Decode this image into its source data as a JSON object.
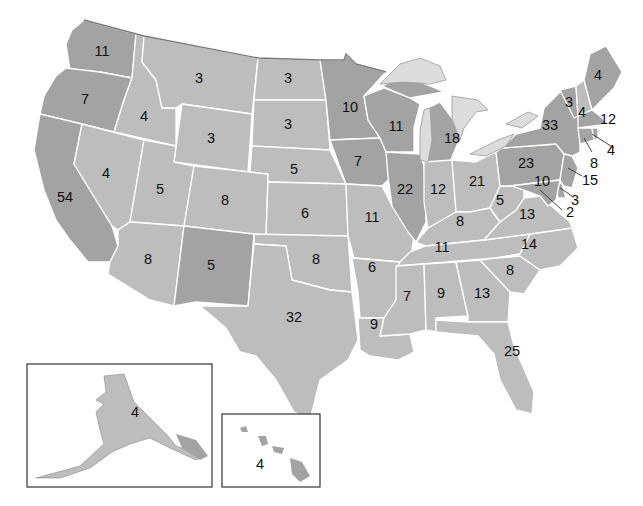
{
  "map": {
    "title": "Electoral votes by state",
    "colors": {
      "state_light": "#bdbdbd",
      "state_dark": "#a3a3a3",
      "borders": "#ffffff",
      "lakes": "#dcdcdc"
    },
    "states": [
      {
        "id": "WA",
        "votes": "11",
        "shade": "dark"
      },
      {
        "id": "OR",
        "votes": "7",
        "shade": "dark"
      },
      {
        "id": "CA",
        "votes": "54",
        "shade": "dark"
      },
      {
        "id": "ID",
        "votes": "4",
        "shade": "light"
      },
      {
        "id": "NV",
        "votes": "4",
        "shade": "light"
      },
      {
        "id": "MT",
        "votes": "3",
        "shade": "light"
      },
      {
        "id": "WY",
        "votes": "3",
        "shade": "light"
      },
      {
        "id": "UT",
        "votes": "5",
        "shade": "light"
      },
      {
        "id": "AZ",
        "votes": "8",
        "shade": "light"
      },
      {
        "id": "CO",
        "votes": "8",
        "shade": "light"
      },
      {
        "id": "NM",
        "votes": "5",
        "shade": "dark"
      },
      {
        "id": "ND",
        "votes": "3",
        "shade": "light"
      },
      {
        "id": "SD",
        "votes": "3",
        "shade": "light"
      },
      {
        "id": "NE",
        "votes": "5",
        "shade": "light"
      },
      {
        "id": "KS",
        "votes": "6",
        "shade": "light"
      },
      {
        "id": "OK",
        "votes": "8",
        "shade": "light"
      },
      {
        "id": "TX",
        "votes": "32",
        "shade": "light"
      },
      {
        "id": "MN",
        "votes": "10",
        "shade": "dark"
      },
      {
        "id": "IA",
        "votes": "7",
        "shade": "dark"
      },
      {
        "id": "MO",
        "votes": "11",
        "shade": "light"
      },
      {
        "id": "AR",
        "votes": "6",
        "shade": "light"
      },
      {
        "id": "LA",
        "votes": "9",
        "shade": "light"
      },
      {
        "id": "WI",
        "votes": "11",
        "shade": "dark"
      },
      {
        "id": "IL",
        "votes": "22",
        "shade": "dark"
      },
      {
        "id": "MI",
        "votes": "18",
        "shade": "dark"
      },
      {
        "id": "IN",
        "votes": "12",
        "shade": "light"
      },
      {
        "id": "OH",
        "votes": "21",
        "shade": "light"
      },
      {
        "id": "KY",
        "votes": "8",
        "shade": "light"
      },
      {
        "id": "TN",
        "votes": "11",
        "shade": "light"
      },
      {
        "id": "MS",
        "votes": "7",
        "shade": "light"
      },
      {
        "id": "AL",
        "votes": "9",
        "shade": "light"
      },
      {
        "id": "GA",
        "votes": "13",
        "shade": "light"
      },
      {
        "id": "FL",
        "votes": "25",
        "shade": "light"
      },
      {
        "id": "SC",
        "votes": "8",
        "shade": "light"
      },
      {
        "id": "NC",
        "votes": "14",
        "shade": "light"
      },
      {
        "id": "VA",
        "votes": "13",
        "shade": "light"
      },
      {
        "id": "WV",
        "votes": "5",
        "shade": "light"
      },
      {
        "id": "PA",
        "votes": "23",
        "shade": "dark"
      },
      {
        "id": "NY",
        "votes": "33",
        "shade": "dark"
      },
      {
        "id": "VT",
        "votes": "3",
        "shade": "dark"
      },
      {
        "id": "NH",
        "votes": "4",
        "shade": "light"
      },
      {
        "id": "ME",
        "votes": "4",
        "shade": "dark"
      },
      {
        "id": "MA",
        "votes": "12",
        "shade": "dark"
      },
      {
        "id": "RI",
        "votes": "4",
        "shade": "dark"
      },
      {
        "id": "CT",
        "votes": "8",
        "shade": "dark"
      },
      {
        "id": "NJ",
        "votes": "15",
        "shade": "dark"
      },
      {
        "id": "DE",
        "votes": "3",
        "shade": "dark"
      },
      {
        "id": "MD",
        "votes": "10",
        "shade": "dark"
      },
      {
        "id": "DC",
        "votes": "2",
        "shade": "dark"
      },
      {
        "id": "AK",
        "votes": "4",
        "shade": "light"
      },
      {
        "id": "HI",
        "votes": "4",
        "shade": "dark"
      }
    ]
  },
  "labels": {
    "WA": "11",
    "OR": "7",
    "CA": "54",
    "ID": "4",
    "NV": "4",
    "MT": "3",
    "WY": "3",
    "UT": "5",
    "AZ": "8",
    "CO": "8",
    "NM": "5",
    "ND": "3",
    "SD": "3",
    "NE": "5",
    "KS": "6",
    "OK": "8",
    "TX": "32",
    "MN": "10",
    "IA": "7",
    "MO": "11",
    "AR": "6",
    "LA": "9",
    "WI": "11",
    "IL": "22",
    "MI": "18",
    "IN": "12",
    "OH": "21",
    "KY": "8",
    "TN": "11",
    "MS": "7",
    "AL": "9",
    "GA": "13",
    "FL": "25",
    "SC": "8",
    "NC": "14",
    "VA": "13",
    "WV": "5",
    "PA": "23",
    "NY": "33",
    "VT": "3",
    "NH": "4",
    "ME": "4",
    "MA": "12",
    "RI": "4",
    "CT": "8",
    "NJ": "15",
    "DE": "3",
    "MD": "10",
    "DC": "2",
    "AK": "4",
    "HI": "4"
  }
}
